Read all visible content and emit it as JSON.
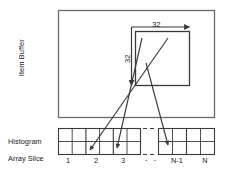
{
  "figure": {
    "type": "diagram",
    "background": "#ffffff",
    "stroke_color": "#3a3a3a",
    "text_color": "#1a1a1a"
  },
  "labels": {
    "item_buffer": "Item Buffer",
    "histogram": "Histogram",
    "array_slice": "Array Slice"
  },
  "dimensions": {
    "horizontal": {
      "value": "32",
      "orientation": "horizontal"
    },
    "vertical": {
      "value": "32",
      "orientation": "vertical"
    }
  },
  "ticks": [
    {
      "label": "1",
      "x": 68
    },
    {
      "label": "2",
      "x": 96
    },
    {
      "label": "3",
      "x": 124
    },
    {
      "label": "N-1",
      "x": 178
    },
    {
      "label": "N",
      "x": 206
    }
  ],
  "item_buffer_rect": {
    "x": 58,
    "y": 10,
    "w": 157,
    "h": 108
  },
  "tile_rect": {
    "x": 135,
    "y": 31,
    "w": 55,
    "h": 55
  },
  "histogram": {
    "top": 128,
    "mid": 141,
    "bottom": 155,
    "left_block": {
      "x": 58,
      "w": 83,
      "cells": 6
    },
    "right_block": {
      "x": 158,
      "w": 57,
      "cells": 4
    },
    "gap_dashes": {
      "x1": 143,
      "x2": 156
    }
  },
  "mapping_arrows": [
    {
      "name": "tile-to-slice-2",
      "x1": 168,
      "y1": 38,
      "x2": 90,
      "y2": 150
    },
    {
      "name": "tile-to-slice-3",
      "x1": 142,
      "y1": 38,
      "x2": 117,
      "y2": 148
    },
    {
      "name": "tile-to-slice-n-1",
      "x1": 146,
      "y1": 63,
      "x2": 168,
      "y2": 145
    }
  ]
}
